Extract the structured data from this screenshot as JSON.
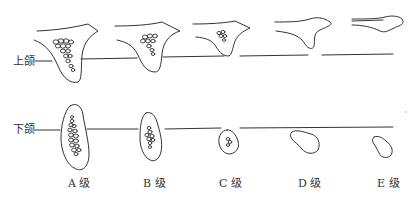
{
  "diagram": {
    "rows": [
      {
        "id": "upper",
        "label": "上颌"
      },
      {
        "id": "lower",
        "label": "下颌"
      }
    ],
    "grades": [
      {
        "id": "A",
        "label": "A 级"
      },
      {
        "id": "B",
        "label": "B 级"
      },
      {
        "id": "C",
        "label": "C 级"
      },
      {
        "id": "D",
        "label": "D 级"
      },
      {
        "id": "E",
        "label": "E 级"
      }
    ],
    "colors": {
      "stroke": "#333333",
      "background": "#ffffff"
    }
  }
}
